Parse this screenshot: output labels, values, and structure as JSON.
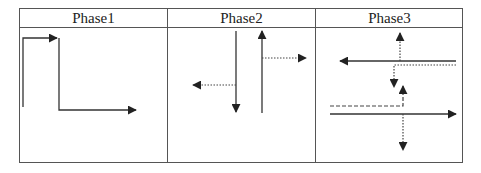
{
  "table": {
    "columns": [
      {
        "header": "Phase1"
      },
      {
        "header": "Phase2"
      },
      {
        "header": "Phase3"
      }
    ]
  },
  "legend_semantics": {
    "solid": "main movement",
    "dotted": "turning movement",
    "dashed": "turning movement (dashed)"
  },
  "colors": {
    "line": "#333333",
    "border": "#555555"
  }
}
